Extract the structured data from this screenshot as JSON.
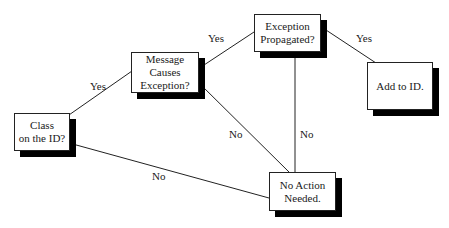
{
  "diagram": {
    "type": "decision-flowchart",
    "nodes": [
      {
        "id": "class_on_id",
        "label": "Class\non the ID?"
      },
      {
        "id": "message_causes_exception",
        "label": "Message\nCauses\nException?"
      },
      {
        "id": "exception_propagated",
        "label": "Exception\nPropagated?"
      },
      {
        "id": "add_to_id",
        "label": "Add to ID."
      },
      {
        "id": "no_action_needed",
        "label": "No Action\nNeeded."
      }
    ],
    "edges": [
      {
        "from": "class_on_id",
        "to": "message_causes_exception",
        "label": "Yes"
      },
      {
        "from": "class_on_id",
        "to": "no_action_needed",
        "label": "No"
      },
      {
        "from": "message_causes_exception",
        "to": "exception_propagated",
        "label": "Yes"
      },
      {
        "from": "message_causes_exception",
        "to": "no_action_needed",
        "label": "No"
      },
      {
        "from": "exception_propagated",
        "to": "add_to_id",
        "label": "Yes"
      },
      {
        "from": "exception_propagated",
        "to": "no_action_needed",
        "label": "No"
      }
    ]
  },
  "labels": {
    "class_line1": "Class",
    "class_line2": "on the ID?",
    "message_line1": "Message",
    "message_line2": "Causes",
    "message_line3": "Exception?",
    "exception_line1": "Exception",
    "exception_line2": "Propagated?",
    "add_line1": "Add to ID.",
    "noaction_line1": "No Action",
    "noaction_line2": "Needed.",
    "edge_class_message": "Yes",
    "edge_class_noaction": "No",
    "edge_message_exception": "Yes",
    "edge_message_noaction": "No",
    "edge_exception_add": "Yes",
    "edge_exception_noaction": "No"
  }
}
